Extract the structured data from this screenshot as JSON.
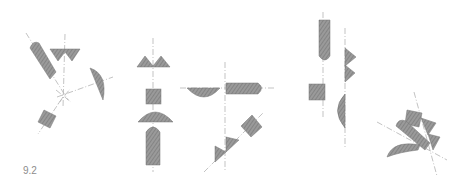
{
  "figure": {
    "caption": "9.2",
    "colors": {
      "fill": "#8e8e8e",
      "fill_dark": "#6f6f6f",
      "axis": "#b4b4b4"
    }
  }
}
